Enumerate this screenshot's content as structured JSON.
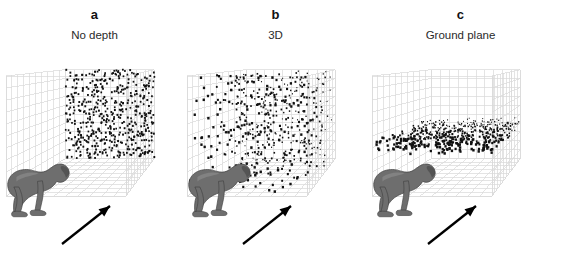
{
  "figure": {
    "background_color": "#ffffff",
    "grid_color": "#d9d9d9",
    "dot_color": "#111111",
    "monkey_fill": "#6e6e6e",
    "monkey_stroke": "#3f3f3f",
    "arrow_color": "#000000"
  },
  "panels": [
    {
      "letter": "a",
      "caption": "No depth",
      "icon_monkey": "monkey-silhouette-icon",
      "icon_arrow": "gaze-arrow-icon"
    },
    {
      "letter": "b",
      "caption": "3D",
      "icon_monkey": "monkey-silhouette-icon",
      "icon_arrow": "gaze-arrow-icon"
    },
    {
      "letter": "c",
      "caption": "Ground plane",
      "icon_monkey": "monkey-silhouette-icon",
      "icon_arrow": "gaze-arrow-icon"
    }
  ],
  "chart_data": [
    {
      "type": "scatter",
      "title": "No depth",
      "panel": "a",
      "description": "Dots confined to the frontoparallel back plane of the wireframe cube; all dots equal size, no depth variation.",
      "n_points": 520,
      "xlabel": "",
      "ylabel": "",
      "zlabel": "",
      "xlim": [
        0,
        1
      ],
      "ylim": [
        0,
        1
      ],
      "zlim": [
        1,
        1
      ],
      "grid": true,
      "legend": "none",
      "dot_size_range_px": [
        1.6,
        1.9
      ],
      "depth_distribution": "single-plane",
      "cube_divisions": 10
    },
    {
      "type": "scatter",
      "title": "3D",
      "panel": "b",
      "description": "Dots distributed uniformly through the full volume of the wireframe cube; dot size scales with depth producing a 3D cloud.",
      "n_points": 520,
      "xlabel": "",
      "ylabel": "",
      "zlabel": "",
      "xlim": [
        0,
        1
      ],
      "ylim": [
        0,
        1
      ],
      "zlim": [
        0,
        1
      ],
      "grid": true,
      "legend": "none",
      "dot_size_range_px": [
        0.9,
        2.4
      ],
      "depth_distribution": "uniform-volume",
      "cube_divisions": 10
    },
    {
      "type": "scatter",
      "title": "Ground plane",
      "panel": "c",
      "description": "Dots confined to a thin horizontal slab near the floor of the wireframe cube; size scales with depth giving a receding ground surface.",
      "n_points": 520,
      "xlabel": "",
      "ylabel": "",
      "zlabel": "",
      "xlim": [
        0,
        1
      ],
      "ylim": [
        0.34,
        0.46
      ],
      "zlim": [
        0,
        1
      ],
      "grid": true,
      "legend": "none",
      "dot_size_range_px": [
        0.9,
        2.4
      ],
      "depth_distribution": "horizontal-slab",
      "cube_divisions": 10
    }
  ]
}
